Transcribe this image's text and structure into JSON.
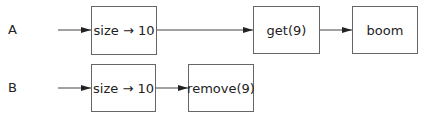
{
  "rows": [
    {
      "label": "A",
      "nodes": [
        "size → 10",
        "get(9)",
        "boom"
      ]
    },
    {
      "label": "B",
      "nodes": [
        "size → 10",
        "remove(9)"
      ]
    }
  ],
  "colors": {
    "line": "#444444",
    "border": "#666666",
    "text": "#222222"
  }
}
